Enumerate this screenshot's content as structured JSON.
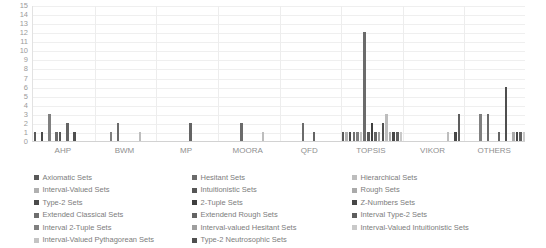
{
  "chart_data": {
    "type": "bar",
    "title": "",
    "xlabel": "",
    "ylabel": "",
    "ylim": [
      0,
      15
    ],
    "grid": true,
    "legend_position": "bottom",
    "categories": [
      "AHP",
      "BWM",
      "MP",
      "MOORA",
      "QFD",
      "TOPSIS",
      "VIKOR",
      "OTHERS"
    ],
    "ytick_labels": [
      "15",
      "14",
      "13",
      "12",
      "11",
      "10",
      "9",
      "8",
      "7",
      "6",
      "5",
      "4",
      "3",
      "2",
      "1",
      "0"
    ],
    "series": [
      {
        "name": "Axiomatic Sets",
        "color": "#595959",
        "values": [
          1,
          0,
          0,
          0,
          0,
          1,
          0,
          0
        ]
      },
      {
        "name": "Interval-Valued  Sets",
        "color": "#b0b0b0",
        "values": [
          0,
          0,
          0,
          0,
          0,
          1,
          0,
          0
        ]
      },
      {
        "name": "Type-2 Sets",
        "color": "#4a4a4a",
        "values": [
          1,
          0,
          0,
          0,
          0,
          1,
          0,
          0
        ]
      },
      {
        "name": "Extended Classical Sets",
        "color": "#6e6e6e",
        "values": [
          0,
          0,
          0,
          0,
          0,
          1,
          0,
          0
        ]
      },
      {
        "name": "Interval 2-Tuple Sets",
        "color": "#808080",
        "values": [
          3,
          1,
          0,
          0,
          0,
          1,
          0,
          3
        ]
      },
      {
        "name": "Interval-Valued Pythagorean Sets",
        "color": "#c4c4c4",
        "values": [
          0,
          0,
          0,
          0,
          0,
          1,
          0,
          0
        ]
      },
      {
        "name": "Hesitant Sets",
        "color": "#6b6b6b",
        "values": [
          1,
          2,
          0,
          2,
          2,
          12,
          0,
          3
        ]
      },
      {
        "name": "Intuitionistic Sets",
        "color": "#565656",
        "values": [
          1,
          0,
          0,
          0,
          0,
          1,
          0,
          0
        ]
      },
      {
        "name": "2-Tuple Sets",
        "color": "#3f3f3f",
        "values": [
          0,
          0,
          0,
          0,
          0,
          2,
          0,
          0
        ]
      },
      {
        "name": "Extendend Rough Sets",
        "color": "#646464",
        "values": [
          2,
          0,
          2,
          0,
          1,
          1,
          0,
          1
        ]
      },
      {
        "name": "Interval-valued Hesitant Sets",
        "color": "#9e9e9e",
        "values": [
          0,
          0,
          0,
          0,
          0,
          1,
          0,
          0
        ]
      },
      {
        "name": "Type-2 Neutrosophic Sets",
        "color": "#4f4f4f",
        "values": [
          1,
          0,
          0,
          0,
          0,
          2,
          0,
          6
        ]
      },
      {
        "name": "Hierarchical Sets",
        "color": "#bdbdbd",
        "values": [
          0,
          1,
          0,
          1,
          0,
          3,
          1,
          0
        ]
      },
      {
        "name": "Rough Sets",
        "color": "#aaaaaa",
        "values": [
          0,
          0,
          0,
          0,
          0,
          1,
          0,
          1
        ]
      },
      {
        "name": "Z-Numbers Sets",
        "color": "#474747",
        "values": [
          0,
          0,
          0,
          0,
          0,
          1,
          1,
          1
        ]
      },
      {
        "name": "Interval Type-2 Sets",
        "color": "#5e5e5e",
        "values": [
          0,
          0,
          0,
          0,
          0,
          1,
          3,
          1
        ]
      },
      {
        "name": "Interval-Valued Intuitionistic Sets",
        "color": "#c9c9c9",
        "values": [
          0,
          0,
          0,
          0,
          0,
          1,
          0,
          1
        ]
      }
    ],
    "legend_columns": [
      [
        "Axiomatic Sets",
        "Interval-Valued  Sets",
        "Type-2 Sets",
        "Extended Classical Sets",
        "Interval 2-Tuple Sets",
        "Interval-Valued Pythagorean Sets"
      ],
      [
        "Hesitant Sets",
        "Intuitionistic Sets",
        "2-Tuple Sets",
        "Extendend Rough Sets",
        "Interval-valued Hesitant Sets",
        "Type-2 Neutrosophic Sets"
      ],
      [
        "Hierarchical Sets",
        "Rough Sets",
        "Z-Numbers Sets",
        "Interval Type-2 Sets",
        "Interval-Valued Intuitionistic Sets"
      ]
    ]
  }
}
